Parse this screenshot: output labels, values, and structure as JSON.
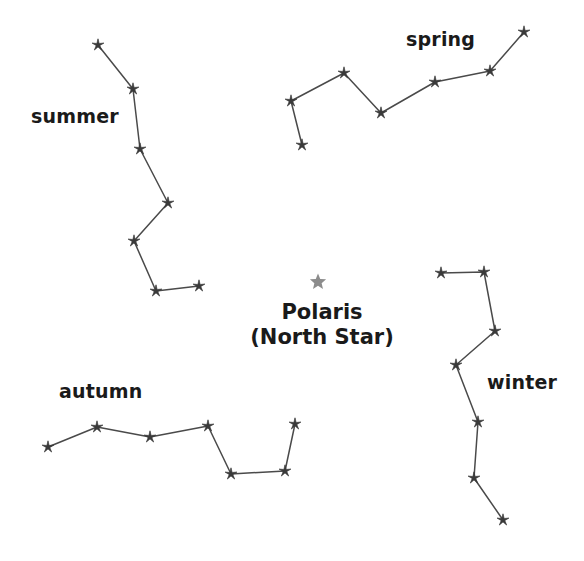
{
  "diagram": {
    "type": "star-chart",
    "background_color": "#ffffff",
    "line_color": "#4a4a4a",
    "star_color": "#3a3a3a",
    "polaris_color": "#8c8c8c",
    "width": 584,
    "height": 561
  },
  "polaris": {
    "name": "Polaris",
    "subtitle": "(North Star)",
    "icon": "star-icon",
    "x": 318,
    "y": 282,
    "size": 17
  },
  "constellations": [
    {
      "id": "summer",
      "label": "summer",
      "label_x": 31,
      "label_y": 105,
      "stars": [
        {
          "x": 98,
          "y": 45
        },
        {
          "x": 133,
          "y": 89
        },
        {
          "x": 140,
          "y": 149
        },
        {
          "x": 168,
          "y": 203
        },
        {
          "x": 134,
          "y": 241
        },
        {
          "x": 156,
          "y": 291
        },
        {
          "x": 199,
          "y": 286
        }
      ]
    },
    {
      "id": "spring",
      "label": "spring",
      "label_x": 406,
      "label_y": 28,
      "stars": [
        {
          "x": 302,
          "y": 145
        },
        {
          "x": 291,
          "y": 101
        },
        {
          "x": 344,
          "y": 73
        },
        {
          "x": 381,
          "y": 113
        },
        {
          "x": 435,
          "y": 82
        },
        {
          "x": 490,
          "y": 71
        },
        {
          "x": 524,
          "y": 32
        }
      ]
    },
    {
      "id": "autumn",
      "label": "autumn",
      "label_x": 59,
      "label_y": 380,
      "stars": [
        {
          "x": 48,
          "y": 447
        },
        {
          "x": 97,
          "y": 427
        },
        {
          "x": 150,
          "y": 437
        },
        {
          "x": 208,
          "y": 426
        },
        {
          "x": 231,
          "y": 474
        },
        {
          "x": 285,
          "y": 471
        },
        {
          "x": 295,
          "y": 424
        }
      ]
    },
    {
      "id": "winter",
      "label": "winter",
      "label_x": 487,
      "label_y": 371,
      "stars": [
        {
          "x": 441,
          "y": 273
        },
        {
          "x": 484,
          "y": 272
        },
        {
          "x": 495,
          "y": 331
        },
        {
          "x": 456,
          "y": 365
        },
        {
          "x": 478,
          "y": 422
        },
        {
          "x": 474,
          "y": 478
        },
        {
          "x": 503,
          "y": 520
        }
      ]
    }
  ]
}
